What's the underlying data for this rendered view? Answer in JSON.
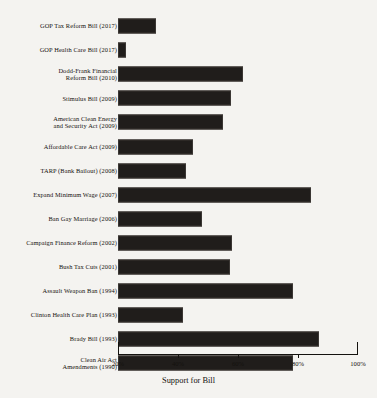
{
  "chart_data": {
    "type": "bar",
    "orientation": "horizontal",
    "title": "",
    "xlabel": "Support for Bill",
    "ylabel": "",
    "xlim": [
      20,
      100
    ],
    "xticks": [
      20,
      40,
      60,
      80,
      100
    ],
    "xtick_labels": [
      "20%",
      "40%",
      "60%",
      "80%",
      "100%"
    ],
    "grid": false,
    "legend": null,
    "bar_color": "#201d1b",
    "background_color": "#f4f3f0",
    "categories": [
      "GOP Tax Reform Bill (2017)",
      "GOP Health Care Bill (2017)",
      "Dodd-Frank Financial\nReform Bill (2010)",
      "Stimulus Bill (2009)",
      "American Clean Energy\nand Security Act (2009)",
      "Affordable Care Act (2009)",
      "TARP (Bank Bailout) (2008)",
      "Expand Minimum Wage (2007)",
      "Ban Gay Marriage (2006)",
      "Campaign Finance Reform (2002)",
      "Bush Tax Cuts (2001)",
      "Assault Weapon Ban (1994)",
      "Clinton Health Care Plan (1993)",
      "Brady Bill (1993)",
      "Clean Air Act\nAmendments (1990)"
    ],
    "values": [
      32.7,
      22.7,
      61.7,
      57.7,
      55.0,
      45.0,
      42.7,
      84.3,
      48.0,
      58.0,
      57.3,
      78.3,
      41.7,
      87.0,
      78.3
    ]
  }
}
